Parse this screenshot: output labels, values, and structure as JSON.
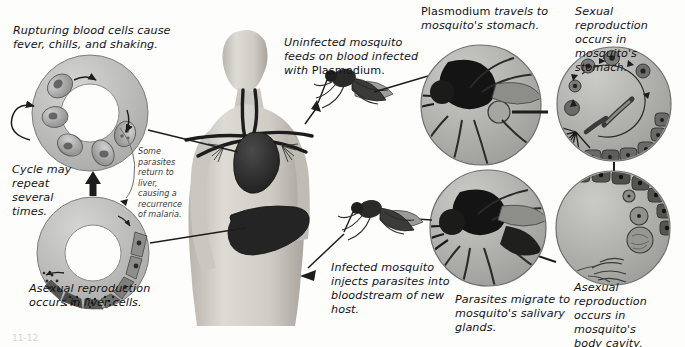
{
  "figure": {
    "width": 685,
    "height": 347,
    "background_color": "#fdfdfc",
    "ink_color": "#141414",
    "style": "grayscale textbook illustration, italic sans-serif captions"
  },
  "captions": {
    "rupturing_cells": "Rupturing blood cells cause\nfever, chills, and shaking.",
    "cycle_repeat": "Cycle may\nrepeat\nseveral\ntimes.",
    "asexual_liver": "Asexual reproduction\noccurs in liver cells.",
    "some_parasites": "Some\nparasites\nreturn to\nliver,\ncausing a\nrecurrence\nof malaria.",
    "uninfected_mosquito_line1": "Uninfected mosquito",
    "uninfected_mosquito_line2": "feeds on blood infected",
    "uninfected_mosquito_line3_italic": "with ",
    "uninfected_mosquito_line3_roman": "Plasmodium.",
    "plasmodium_travels_roman": "Plasmodium",
    "plasmodium_travels_italic": " travels to\nmosquito's stomach.",
    "sexual_stomach": "Sexual reproduction\noccurs in mosquito's\nstomach.",
    "asexual_body_cavity": "Asexual reproduction\noccurs in mosquito's\nbody cavity.",
    "parasites_migrate": "Parasites migrate to\nmosquito's salivary\nglands.",
    "infected_mosquito": "Infected mosquito\ninjects parasites into\nbloodstream of new\nhost.",
    "page_mark": "11-12"
  },
  "panels": [
    {
      "id": "blood-cell-ring",
      "name": "Rupturing blood cells ring",
      "shape": "annulus",
      "caption_key": "rupturing_cells",
      "contents": "Ring of infected red blood cells with internal parasites, clockwise arrows"
    },
    {
      "id": "liver-cell-ring",
      "name": "Asexual reproduction in liver cells ring",
      "shape": "annulus",
      "caption_key": "asexual_liver",
      "contents": "Ring of liver cells progressing to merozoite-filled cells"
    },
    {
      "id": "human-figure",
      "name": "Human torso",
      "shape": "anatomical",
      "contents": "Head, shoulders and torso showing heart, liver and major blood vessels"
    },
    {
      "id": "mosquito-feeding",
      "name": "Uninfected mosquito feeding",
      "shape": "illustration",
      "caption_key": "uninfected_mosquito"
    },
    {
      "id": "mosquito-stomach-circle",
      "name": "Mosquito stomach inset",
      "shape": "circle",
      "caption_key": "plasmodium_travels",
      "contents": "Magnified mosquito head and thorax, stomach highlighted"
    },
    {
      "id": "sexual-reproduction-circle",
      "name": "Sexual reproduction inset",
      "shape": "circle",
      "caption_key": "sexual_stomach",
      "contents": "Circular arrow cycle of gametocytes fusing into an oocyst with bursting sporozoites"
    },
    {
      "id": "body-cavity-circle",
      "name": "Asexual reproduction body cavity inset",
      "shape": "circle",
      "caption_key": "asexual_body_cavity",
      "contents": "Oocysts on stomach wall releasing sporozoites into body cavity"
    },
    {
      "id": "salivary-gland-circle",
      "name": "Salivary gland inset",
      "shape": "circle",
      "caption_key": "parasites_migrate",
      "contents": "Magnified mosquito with salivary glands and proboscis"
    },
    {
      "id": "mosquito-injecting",
      "name": "Infected mosquito injecting parasites",
      "shape": "illustration",
      "caption_key": "infected_mosquito"
    }
  ],
  "arrows": [
    {
      "id": "cycle-loop-arrow",
      "name": "Cycle repeat loop arrow",
      "direction": "circular"
    },
    {
      "id": "liver-to-blood-arrow",
      "name": "Liver ring to blood ring arrow",
      "direction": "up"
    },
    {
      "id": "blood-to-human-arrow",
      "name": "Blood ring to human arrow",
      "direction": "right"
    },
    {
      "id": "human-to-liver-arrow",
      "name": "Human liver to liver ring arrow",
      "direction": "left"
    },
    {
      "id": "human-to-mosquito-arrow",
      "name": "Human to feeding mosquito arrow",
      "direction": "right"
    },
    {
      "id": "mosquito-to-stomach-arrow",
      "name": "Feeding mosquito to stomach inset arrow",
      "direction": "right"
    },
    {
      "id": "stomach-to-sexual-arrow",
      "name": "Stomach inset to sexual reproduction arrow",
      "direction": "right"
    },
    {
      "id": "sexual-to-cavity-arrow",
      "name": "Sexual to body cavity arrow",
      "direction": "down"
    },
    {
      "id": "cavity-to-salivary-arrow",
      "name": "Body cavity to salivary gland arrow",
      "direction": "left"
    },
    {
      "id": "salivary-to-injection-arrow",
      "name": "Salivary inset to injecting mosquito arrow",
      "direction": "left"
    },
    {
      "id": "injection-to-human-arrow",
      "name": "Injecting mosquito to human arrow",
      "direction": "left-down"
    }
  ],
  "palette": {
    "cell_light": "#c9c9c9",
    "cell_mid": "#9a9a9a",
    "cell_dark": "#6e6e6e",
    "organ_dark": "#2e2e2e",
    "skin_light": "#d8d5d0",
    "skin_mid": "#bdb9b2",
    "outline": "#3a3a3a"
  }
}
